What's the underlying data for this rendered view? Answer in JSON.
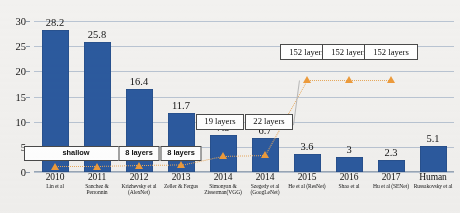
{
  "chart_data": {
    "type": "bar",
    "title": "",
    "subtitle": "",
    "xlabel": "",
    "ylabel": "",
    "ylim": [
      0,
      30
    ],
    "ytick_step": 5,
    "yticks": [
      "0",
      "5",
      "10",
      "15",
      "20",
      "25",
      "30"
    ],
    "grid": true,
    "legend_position": "none",
    "categories": [
      "2010",
      "2011",
      "2012",
      "2013",
      "2014",
      "2014",
      "2015",
      "2016",
      "2017",
      "Human"
    ],
    "category_sublabels": [
      "Lin et al",
      "Sanchez & Perronnin",
      "Krizhevsky et al (AlexNet)",
      "Zeller & Fergus",
      "Simonyan & Zisserman(VGG)",
      "Szegedy et al (GoogLeNet)",
      "He et al (ResNet)",
      "Shao et al",
      "Hu et al (SENet)",
      "Russakovsky et al"
    ],
    "values": [
      28.2,
      25.8,
      16.4,
      11.7,
      7.3,
      6.7,
      3.6,
      3,
      2.3,
      5.1
    ],
    "value_labels": [
      "28.2",
      "25.8",
      "16.4",
      "11.7",
      "7.3",
      "6.7",
      "3.6",
      "3",
      "2.3",
      "5.1"
    ],
    "bar_color": "#2c5a9e",
    "series": [
      {
        "name": "error-rate",
        "values": [
          28.2,
          25.8,
          16.4,
          11.7,
          7.3,
          6.7,
          3.6,
          3,
          2.3,
          5.1
        ]
      },
      {
        "name": "network-depth-marker",
        "type": "scatter",
        "marker": "triangle",
        "marker_color": "#ed9b3b",
        "connector": "dotted",
        "point_categories": [
          "2010",
          "2011",
          "2012",
          "2013",
          "2014",
          "2014",
          "2015",
          "2016",
          "2017"
        ],
        "point_y": [
          1.1,
          1.1,
          1.3,
          1.4,
          3.2,
          3.4,
          18.3,
          18.3,
          18.3
        ],
        "annotations": [
          "shallow",
          "shallow",
          "8 layers",
          "8 layers",
          "19 layers",
          "22 layers",
          "152 layers",
          "152 layers",
          "152 layers"
        ]
      }
    ],
    "callouts": [
      {
        "label": "shallow",
        "style": "bold",
        "target_index": 0,
        "span": "2010-2011"
      },
      {
        "label": "8 layers",
        "style": "bold",
        "target_index": 2
      },
      {
        "label": "8 layers",
        "style": "bold",
        "target_index": 3
      },
      {
        "label": "19 layers",
        "style": "serif",
        "target_index": 4
      },
      {
        "label": "22 layers",
        "style": "serif",
        "target_index": 5
      },
      {
        "label": "152 layers",
        "style": "serif",
        "target_index": 6
      },
      {
        "label": "152 layers",
        "style": "serif",
        "target_index": 7
      },
      {
        "label": "152 layers",
        "style": "serif",
        "target_index": 8
      }
    ]
  },
  "colors": {
    "bar": "#2c5a9e",
    "marker": "#ed9b3b",
    "gridline": "#b9c4d2",
    "background": "#f2f1ef",
    "text": "#141414"
  }
}
